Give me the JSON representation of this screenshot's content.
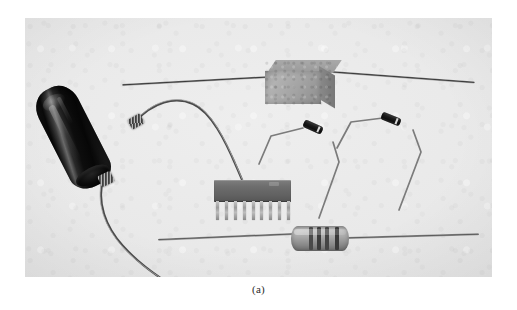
{
  "figure": {
    "caption": "(a)",
    "kind": "photograph",
    "colors": {
      "page_background": "#ffffff",
      "photo_background": "#e9e9e9",
      "capacitor_body": "#0d0d0d",
      "wirewound_body": "#a4a4a4",
      "sip_body": "#616161",
      "resistor_body": "#aaaaaa",
      "lead_metal": "#5d5d5d",
      "caption_text": "#2a2a2a"
    },
    "plate": {
      "x": 25,
      "y": 18,
      "width": 467,
      "height": 259
    }
  },
  "components": [
    {
      "id": "axial-capacitor",
      "label": "axial electrolytic capacitor",
      "position": "left",
      "body_color": "#0d0d0d",
      "lead_count": 2
    },
    {
      "id": "wirewound-resistor",
      "label": "ceramic wirewound power resistor",
      "position": "top",
      "body_color": "#a4a4a4",
      "lead_count": 2
    },
    {
      "id": "diode-left",
      "label": "glass axial diode with formed leads",
      "position": "center-right",
      "body_color": "#141414",
      "band_color": "#d8d8d8"
    },
    {
      "id": "diode-right",
      "label": "glass axial diode with formed leads",
      "position": "right",
      "body_color": "#141414",
      "band_color": "#d8d8d8"
    },
    {
      "id": "sip-package",
      "label": "single in-line package integrated circuit",
      "position": "center",
      "body_color": "#616161",
      "pin_count": 9
    },
    {
      "id": "carbon-resistor",
      "label": "axial carbon-film resistor",
      "position": "bottom",
      "body_color": "#aaaaaa",
      "band_count": 4,
      "bands": [
        {
          "offset": 18,
          "width": 4,
          "color": "#4a4a4a"
        },
        {
          "offset": 26,
          "width": 4,
          "color": "#3c3c3c"
        },
        {
          "offset": 34,
          "width": 4,
          "color": "#454545"
        },
        {
          "offset": 44,
          "width": 4,
          "color": "#3a3a3a"
        }
      ]
    }
  ],
  "sip": {
    "pins": [
      1,
      2,
      3,
      4,
      5,
      6,
      7,
      8,
      9
    ]
  }
}
